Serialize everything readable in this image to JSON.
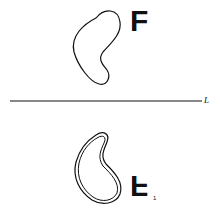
{
  "diagram": {
    "type": "reflection-across-line",
    "line_label": "L",
    "original_figure_label": "F",
    "image_figure_label": "F",
    "image_subscript": "1",
    "colors": {
      "stroke": "#111111",
      "background": "#ffffff"
    }
  }
}
